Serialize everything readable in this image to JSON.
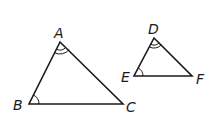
{
  "diagram": {
    "triangle_abc": {
      "vertices": {
        "A": [
          60,
          42
        ],
        "B": [
          29,
          104
        ],
        "C": [
          123,
          104
        ]
      },
      "labels": {
        "A": "A",
        "B": "B",
        "C": "C"
      },
      "angle_marks": {
        "A": "double arc",
        "B": "single arc"
      }
    },
    "triangle_def": {
      "vertices": {
        "D": [
          154,
          38
        ],
        "E": [
          134,
          76
        ],
        "F": [
          192,
          76
        ]
      },
      "labels": {
        "D": "D",
        "E": "E",
        "F": "F"
      },
      "angle_marks": {
        "D": "double arc",
        "E": "single arc"
      }
    },
    "stroke_color": "#1a1a1a"
  }
}
